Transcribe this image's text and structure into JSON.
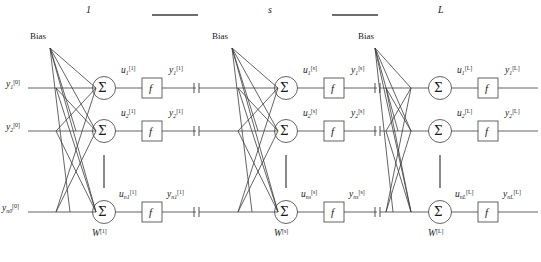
{
  "figure": {
    "background_color": "#ffffff",
    "line_color": "#3c3c3c",
    "text_color": "#1a1a1a"
  },
  "layer_headers": [
    {
      "name": "layer-header-1",
      "label": "1",
      "x": 88,
      "y": 10
    },
    {
      "name": "layer-header-s",
      "label": "s",
      "x": 270,
      "y": 10
    },
    {
      "name": "layer-header-L",
      "label": "L",
      "x": 440,
      "y": 10
    }
  ],
  "header_rules": [
    {
      "name": "header-rule-left",
      "x1": 152,
      "x2": 198,
      "y": 15
    },
    {
      "name": "header-rule-right",
      "x1": 332,
      "x2": 378,
      "y": 15
    }
  ],
  "blocks": [
    {
      "id": "block-1",
      "superscript": "[1]",
      "bias_label": "Bias",
      "weight_label": "W",
      "weight_superscript": "[1]",
      "input_labels": [
        {
          "base": "y",
          "sub": "1",
          "sup": "[0]"
        },
        {
          "base": "y",
          "sub": "2",
          "sup": "[0]"
        },
        {
          "base": "y",
          "sub": "n0",
          "sup": "[0]"
        }
      ],
      "u_labels": [
        {
          "base": "u",
          "sub": "1",
          "sup": "[1]"
        },
        {
          "base": "u",
          "sub": "2",
          "sup": "[1]"
        },
        {
          "base": "u",
          "sub": "n1",
          "sup": "[1]"
        }
      ],
      "y_labels": [
        {
          "base": "y",
          "sub": "1",
          "sup": "[1]"
        },
        {
          "base": "y",
          "sub": "2",
          "sup": "[1]"
        },
        {
          "base": "y",
          "sub": "n1",
          "sup": "[1]"
        }
      ],
      "sum_glyph": "Σ",
      "activation_glyph": "f"
    },
    {
      "id": "block-s",
      "superscript": "[s]",
      "bias_label": "Bias",
      "weight_label": "W",
      "weight_superscript": "[s]",
      "input_labels": [
        {
          "base": "y",
          "sub": "1",
          "sup": "[1]"
        },
        {
          "base": "y",
          "sub": "2",
          "sup": "[1]"
        },
        {
          "base": "y",
          "sub": "n1",
          "sup": "[1]"
        }
      ],
      "u_labels": [
        {
          "base": "u",
          "sub": "1",
          "sup": "[s]"
        },
        {
          "base": "u",
          "sub": "2",
          "sup": "[s]"
        },
        {
          "base": "u",
          "sub": "ns",
          "sup": "[s]"
        }
      ],
      "y_labels": [
        {
          "base": "y",
          "sub": "1",
          "sup": "[s]"
        },
        {
          "base": "y",
          "sub": "2",
          "sup": "[s]"
        },
        {
          "base": "y",
          "sub": "ns",
          "sup": "[s]"
        }
      ],
      "sum_glyph": "Σ",
      "activation_glyph": "f"
    },
    {
      "id": "block-L",
      "superscript": "[L]",
      "bias_label": "Bias",
      "weight_label": "W",
      "weight_superscript": "[L]",
      "input_labels": [
        {
          "base": "y",
          "sub": "1",
          "sup": "[s]"
        },
        {
          "base": "y",
          "sub": "2",
          "sup": "[s]"
        },
        {
          "base": "y",
          "sub": "ns",
          "sup": "[s]"
        }
      ],
      "u_labels": [
        {
          "base": "u",
          "sub": "1",
          "sup": "[L]"
        },
        {
          "base": "u",
          "sub": "2",
          "sup": "[L]"
        },
        {
          "base": "u",
          "sub": "nL",
          "sup": "[L]"
        }
      ],
      "y_labels": [
        {
          "base": "y",
          "sub": "1",
          "sup": "[L]"
        },
        {
          "base": "y",
          "sub": "2",
          "sup": "[L]"
        },
        {
          "base": "y",
          "sub": "nL",
          "sup": "[L]"
        }
      ],
      "sum_glyph": "Σ",
      "activation_glyph": "f"
    }
  ],
  "vertical_ellipsis": {
    "name": "vertical-continuation-mark",
    "description": "vertical rule indicating omitted neurons"
  },
  "break_marks": {
    "name": "signal-break-mark",
    "description": "double tick mark indicating a broken/continued signal line"
  },
  "row_y": [
    88,
    131,
    212
  ],
  "geometry": {
    "width": 541,
    "height": 262
  }
}
